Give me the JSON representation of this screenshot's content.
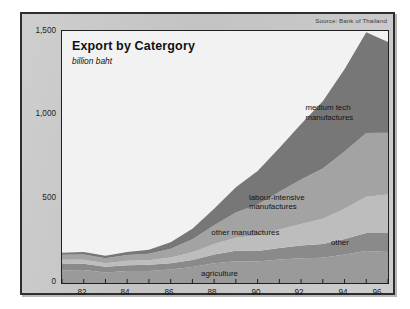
{
  "card": {
    "source_note": "Source: Bank of Thailand"
  },
  "chart_data": {
    "type": "area",
    "stacked": true,
    "title": "Export by Catergory",
    "subtitle": "billion baht",
    "xlabel": "",
    "ylabel": "billion baht",
    "ylim": [
      0,
      1500
    ],
    "yticks": [
      0,
      500,
      1000,
      1500
    ],
    "ytick_labels": [
      "0",
      "500",
      "1,000",
      "1,500"
    ],
    "xlim": [
      1981,
      1996
    ],
    "xticks": [
      1982,
      1984,
      1986,
      1988,
      1990,
      1992,
      1994,
      1996
    ],
    "xtick_labels": [
      "82",
      "84",
      "86",
      "88",
      "90",
      "92",
      "94",
      "96"
    ],
    "grid": false,
    "legend": "inline-annotations",
    "x": [
      1981,
      1982,
      1983,
      1984,
      1985,
      1986,
      1987,
      1988,
      1989,
      1990,
      1991,
      1992,
      1993,
      1994,
      1995,
      1996
    ],
    "series": [
      {
        "name": "agriculture",
        "label": "agriculture",
        "color": "#9a9a9a",
        "values": [
          75,
          78,
          62,
          72,
          72,
          80,
          95,
          118,
          130,
          128,
          140,
          148,
          150,
          170,
          190,
          185
        ]
      },
      {
        "name": "other",
        "label": "other",
        "color": "#8a8a8a",
        "values": [
          38,
          36,
          34,
          34,
          36,
          38,
          42,
          52,
          62,
          62,
          68,
          75,
          82,
          92,
          108,
          112
        ]
      },
      {
        "name": "other manufactures",
        "label": "other manufactures",
        "color": "#bdbdbd",
        "values": [
          25,
          24,
          22,
          26,
          28,
          34,
          46,
          62,
          78,
          92,
          110,
          128,
          150,
          180,
          215,
          230
        ]
      },
      {
        "name": "labour-intensive manufactures",
        "label": "labour-intensive manufactures",
        "color": "#a3a3a3",
        "values": [
          30,
          32,
          30,
          34,
          38,
          52,
          78,
          112,
          150,
          185,
          225,
          265,
          300,
          340,
          380,
          368
        ]
      },
      {
        "name": "medium tech manufactures",
        "label": "medium tech manufactures",
        "color": "#777777",
        "values": [
          12,
          14,
          14,
          18,
          24,
          38,
          62,
          98,
          150,
          200,
          260,
          330,
          400,
          490,
          600,
          540
        ]
      }
    ],
    "annotations": [
      {
        "text": "medium tech",
        "x": 1992.2,
        "y": 1040
      },
      {
        "text": "manufactures",
        "x": 1992.2,
        "y": 985
      },
      {
        "text": "labour-intensive",
        "x": 1989.6,
        "y": 505
      },
      {
        "text": "manufactures",
        "x": 1989.6,
        "y": 452
      },
      {
        "text": "other manufactures",
        "x": 1991.0,
        "y": 300
      },
      {
        "text": "other",
        "x": 1994.2,
        "y": 240
      },
      {
        "text": "agriculture",
        "x": 1987.4,
        "y": 55
      }
    ]
  }
}
